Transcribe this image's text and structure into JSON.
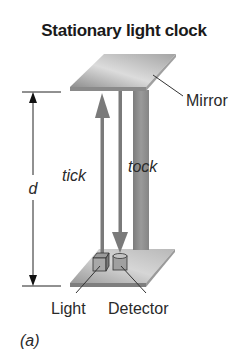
{
  "figure": {
    "title": "Stationary light clock",
    "panel_label": "(a)",
    "labels": {
      "mirror": "Mirror",
      "tick": "tick",
      "tock": "tock",
      "distance": "d",
      "light": "Light",
      "detector": "Detector"
    },
    "colors": {
      "mirror_light": "#d8d8d8",
      "mirror_dark": "#8a8a8a",
      "pillar": "#8c8c8c",
      "arrow": "#7a7a7a",
      "line": "#222222"
    }
  }
}
